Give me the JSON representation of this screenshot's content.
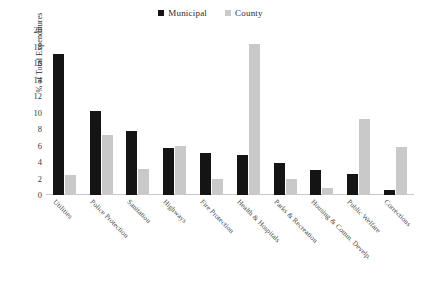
{
  "legend": {
    "position": "top-center",
    "entries": [
      {
        "label": "Municipal",
        "color": "#141414",
        "icon": "square-marker-icon"
      },
      {
        "label": "County",
        "color": "#c9c9c9",
        "icon": "square-marker-icon"
      }
    ]
  },
  "axes": {
    "y_title": "% of Total Expenditures",
    "y_ticks": [
      "0",
      "2",
      "4",
      "6",
      "8",
      "10",
      "12",
      "14",
      "16",
      "18",
      "20"
    ],
    "x_title": ""
  },
  "chart_data": {
    "type": "bar",
    "title": "",
    "subtitle": "",
    "xlabel": "",
    "ylabel": "% of Total Expenditures",
    "ylim": [
      0,
      20
    ],
    "ytick_step": 2,
    "grid": false,
    "legend_position": "top-center",
    "categories": [
      "Utilities",
      "Police Protection",
      "Sanitation",
      "Highways",
      "Fire Protection",
      "Health & Hospitals",
      "Parks & Recreation",
      "Housing & Comm. Develp.",
      "Public Welfare",
      "Corrections"
    ],
    "series": [
      {
        "name": "Municipal",
        "color": "#141414",
        "values": [
          17.1,
          10.2,
          7.7,
          5.7,
          5.1,
          4.8,
          3.9,
          3.0,
          2.5,
          0.6
        ]
      },
      {
        "name": "County",
        "color": "#c9c9c9",
        "values": [
          2.4,
          7.3,
          3.2,
          6.0,
          2.0,
          18.3,
          1.9,
          0.9,
          9.2,
          5.8
        ]
      }
    ]
  }
}
